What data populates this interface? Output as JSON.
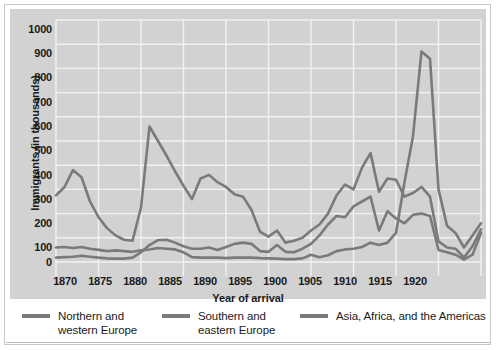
{
  "chart_data": {
    "type": "line",
    "title": "",
    "xlabel": "Year of arrival",
    "ylabel": "Immigrants (in thousands)",
    "xlim": [
      1870,
      1920
    ],
    "ylim": [
      0,
      1000
    ],
    "xticks": [
      "1870",
      "1875",
      "1880",
      "1885",
      "1890",
      "1895",
      "1900",
      "1905",
      "1910",
      "1915",
      "1920"
    ],
    "yticks": [
      "0",
      "100",
      "200",
      "300",
      "400",
      "500",
      "600",
      "700",
      "800",
      "900",
      "1000"
    ],
    "grid": true,
    "legend_position": "bottom",
    "x": [
      1870,
      1871,
      1872,
      1873,
      1874,
      1875,
      1876,
      1877,
      1878,
      1879,
      1880,
      1881,
      1882,
      1883,
      1884,
      1885,
      1886,
      1887,
      1888,
      1889,
      1890,
      1891,
      1892,
      1893,
      1894,
      1895,
      1896,
      1897,
      1898,
      1899,
      1900,
      1901,
      1902,
      1903,
      1904,
      1905,
      1906,
      1907,
      1908,
      1909,
      1910,
      1911,
      1912,
      1913,
      1914,
      1915,
      1916,
      1917,
      1918,
      1919,
      1920
    ],
    "series": [
      {
        "name": "Northern and western Europe",
        "color": "#7a7a7a",
        "values": [
          275,
          310,
          380,
          350,
          250,
          185,
          140,
          110,
          92,
          88,
          225,
          560,
          500,
          440,
          375,
          315,
          260,
          345,
          360,
          330,
          310,
          280,
          270,
          215,
          125,
          105,
          130,
          80,
          88,
          100,
          130,
          155,
          200,
          275,
          320,
          300,
          390,
          450,
          290,
          345,
          340,
          270,
          285,
          310,
          270,
          85,
          60,
          55,
          18,
          65,
          135
        ],
        "max_label": "peak ~560 at 1881"
      },
      {
        "name": "Southern and eastern Europe",
        "color": "#7a7a7a",
        "values": [
          18,
          20,
          22,
          26,
          22,
          18,
          15,
          14,
          14,
          18,
          40,
          70,
          90,
          92,
          80,
          65,
          55,
          55,
          60,
          50,
          62,
          75,
          80,
          75,
          45,
          42,
          70,
          42,
          40,
          55,
          75,
          110,
          155,
          190,
          185,
          230,
          250,
          270,
          130,
          210,
          180,
          160,
          195,
          200,
          190,
          50,
          40,
          30,
          10,
          30,
          120
        ],
        "max_label": "peak ~270 at 1907"
      },
      {
        "name": "Asia, Africa, and the Americas",
        "color": "#7a7a7a",
        "values": [
          60,
          62,
          58,
          62,
          55,
          50,
          45,
          48,
          45,
          42,
          48,
          52,
          58,
          55,
          52,
          40,
          20,
          18,
          18,
          18,
          16,
          18,
          18,
          18,
          16,
          15,
          14,
          12,
          12,
          15,
          30,
          20,
          28,
          45,
          52,
          55,
          62,
          80,
          70,
          80,
          120,
          330,
          520,
          870,
          840,
          300,
          150,
          120,
          60,
          110,
          160
        ],
        "max_label": "peak ~870 at 1913"
      }
    ]
  },
  "legend": {
    "items": [
      {
        "label": "Northern and\nwestern Europe",
        "swatch_name": "legend-swatch-northern-western-europe"
      },
      {
        "label": "Southern and\neastern Europe",
        "swatch_name": "legend-swatch-southern-eastern-europe"
      },
      {
        "label": "Asia, Africa, and the Americas",
        "swatch_name": "legend-swatch-asia-africa-americas"
      }
    ]
  },
  "colors": {
    "plot_background": "#d2d2d2",
    "gridline": "#f2f2f2",
    "line": "#7a7a7a",
    "text": "#1a1a1a",
    "figure_border": "#c9c9c9"
  }
}
